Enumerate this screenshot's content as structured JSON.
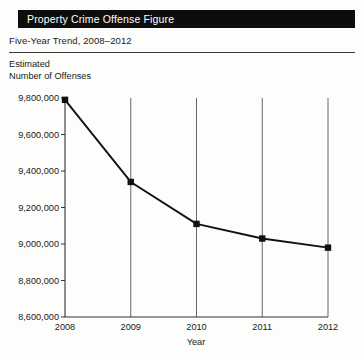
{
  "header": {
    "title": "Property Crime Offense Figure",
    "subtitle": "Five-Year Trend, 2008–2012"
  },
  "axis_titles": {
    "y_line1": "Estimated",
    "y_line2": "Number of Offenses",
    "x": "Year"
  },
  "colors": {
    "banner_bg": "#0d0d0d",
    "banner_text": "#ffffff",
    "line": "#111111",
    "marker": "#111111",
    "gridline": "#555555",
    "axis": "#333333",
    "page_bg": "#fdfdfc"
  },
  "chart_data": {
    "type": "line",
    "title": "Property Crime Offense Figure",
    "subtitle": "Five-Year Trend, 2008–2012",
    "xlabel": "Year",
    "ylabel": "Estimated Number of Offenses",
    "categories": [
      "2008",
      "2009",
      "2010",
      "2011",
      "2012"
    ],
    "x": [
      2008,
      2009,
      2010,
      2011,
      2012
    ],
    "values": [
      9790000,
      9340000,
      9110000,
      9030000,
      8980000
    ],
    "series": [
      {
        "name": "Estimated Number of Offenses",
        "values": [
          9790000,
          9340000,
          9110000,
          9030000,
          8980000
        ]
      }
    ],
    "ylim": [
      8600000,
      9800000
    ],
    "yticks": [
      8600000,
      8800000,
      9000000,
      9200000,
      9400000,
      9600000,
      9800000
    ],
    "ytick_labels": [
      "8,600,000",
      "8,800,000",
      "9,000,000",
      "9,200,000",
      "9,400,000",
      "9,600,000",
      "9,800,000"
    ],
    "xtick_labels": [
      "2008",
      "2009",
      "2010",
      "2011",
      "2012"
    ],
    "grid": "vertical",
    "legend": "none",
    "marker": "square"
  }
}
